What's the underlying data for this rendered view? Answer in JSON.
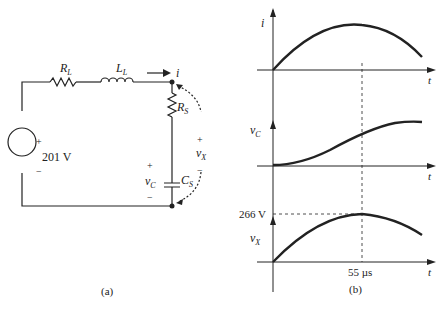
{
  "circuit": {
    "label": "(a)",
    "source_voltage": "201 V",
    "source_plus": "+",
    "source_minus": "−",
    "resistor_L": "R",
    "resistor_L_sub": "L",
    "inductor_L": "L",
    "inductor_L_sub": "L",
    "current": "i",
    "resistor_S": "R",
    "resistor_S_sub": "S",
    "capacitor_S": "C",
    "capacitor_S_sub": "S",
    "vc": "v",
    "vc_sub": "C",
    "vc_plus": "+",
    "vc_minus": "−",
    "vx": "v",
    "vx_sub": "X",
    "vx_plus": "+",
    "vx_minus": "−"
  },
  "graphs": {
    "label": "(b)",
    "i_label": "i",
    "vc_label": "v",
    "vc_sub": "C",
    "vx_label": "v",
    "vx_sub": "X",
    "t_label": "t",
    "peak_voltage": "266 V",
    "peak_time": "55 µs"
  }
}
